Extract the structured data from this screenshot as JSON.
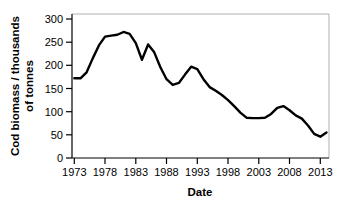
{
  "chart_data": {
    "type": "line",
    "title": "",
    "xlabel": "Date",
    "ylabel": "Cod biomass / thousands of tonnes",
    "xlim": [
      1972,
      2015
    ],
    "ylim": [
      0,
      310
    ],
    "xticks": [
      "1973",
      "1978",
      "1983",
      "1988",
      "1993",
      "1998",
      "2003",
      "2008",
      "2013"
    ],
    "xtick_values": [
      1973,
      1978,
      1983,
      1988,
      1993,
      1998,
      2003,
      2008,
      2013
    ],
    "yticks": [
      "0",
      "50",
      "100",
      "150",
      "200",
      "250",
      "300"
    ],
    "ytick_values": [
      0,
      50,
      100,
      150,
      200,
      250,
      300
    ],
    "grid": false,
    "legend": false,
    "line_color": "#000000",
    "line_width": 2.4,
    "series": [
      {
        "name": "Cod biomass",
        "x": [
          1973,
          1974,
          1975,
          1976,
          1977,
          1978,
          1979,
          1980,
          1981,
          1982,
          1983,
          1984,
          1985,
          1986,
          1987,
          1988,
          1989,
          1990,
          1991,
          1992,
          1993,
          1994,
          1995,
          1996,
          1997,
          1998,
          1999,
          2000,
          2001,
          2002,
          2003,
          2004,
          2005,
          2006,
          2007,
          2008,
          2009,
          2010,
          2011,
          2012,
          2013,
          2014
        ],
        "values": [
          172,
          172,
          185,
          215,
          243,
          262,
          264,
          266,
          272,
          268,
          248,
          212,
          245,
          228,
          196,
          170,
          158,
          162,
          180,
          197,
          192,
          170,
          153,
          145,
          136,
          125,
          112,
          98,
          87,
          86,
          86,
          87,
          95,
          108,
          112,
          103,
          92,
          85,
          70,
          52,
          46,
          55
        ]
      }
    ]
  },
  "axis": {
    "xlabel_name": "Date",
    "ylabel_line1": "Cod biomass / thousands",
    "ylabel_line2": "of tonnes"
  }
}
